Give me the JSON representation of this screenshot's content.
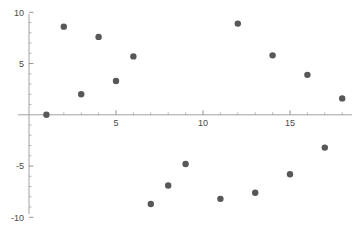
{
  "chart_data": {
    "type": "scatter",
    "title": "",
    "subtitle": "",
    "xlabel": "",
    "ylabel": "",
    "xlim": [
      -0.7,
      18.9
    ],
    "ylim": [
      -10.8,
      11.0
    ],
    "grid": false,
    "legend": null,
    "marker": {
      "shape": "circle",
      "color": "#585858",
      "size": 3.2
    },
    "x_ticks_major": [
      5,
      10,
      15
    ],
    "x_tick_labels": [
      "5",
      "10",
      "15"
    ],
    "x_ticks_minor": [
      1,
      2,
      3,
      4,
      6,
      7,
      8,
      9,
      11,
      12,
      13,
      14,
      16,
      17,
      18
    ],
    "y_ticks_major": [
      10,
      5,
      -5,
      -10
    ],
    "y_tick_labels": [
      "10",
      "5",
      "-5",
      "-10"
    ],
    "y_ticks_minor": [
      9,
      8,
      7,
      6,
      4,
      3,
      2,
      1,
      -1,
      -2,
      -3,
      -4,
      -6,
      -7,
      -8,
      -9
    ],
    "axes": {
      "x_axis_at_y": 0,
      "y_axis_at_x": 0,
      "x_axis_color": "#8a8a8a",
      "y_axis_color": "#8a8a8a"
    },
    "points": [
      {
        "x": 1,
        "y": 0.0
      },
      {
        "x": 2,
        "y": 8.6
      },
      {
        "x": 3,
        "y": 2.0
      },
      {
        "x": 4,
        "y": 7.6
      },
      {
        "x": 5,
        "y": 3.3
      },
      {
        "x": 6,
        "y": 5.7
      },
      {
        "x": 7,
        "y": -8.7
      },
      {
        "x": 8,
        "y": -6.9
      },
      {
        "x": 9,
        "y": -4.8
      },
      {
        "x": 11,
        "y": -8.2
      },
      {
        "x": 12,
        "y": 8.9
      },
      {
        "x": 13,
        "y": -7.6
      },
      {
        "x": 14,
        "y": 5.8
      },
      {
        "x": 15,
        "y": -5.8
      },
      {
        "x": 16,
        "y": 3.9
      },
      {
        "x": 17,
        "y": -3.2
      },
      {
        "x": 18,
        "y": 1.6
      }
    ],
    "x": [
      1,
      2,
      3,
      4,
      5,
      6,
      7,
      8,
      9,
      11,
      12,
      13,
      14,
      15,
      16,
      17,
      18
    ],
    "values": [
      0.0,
      8.6,
      2.0,
      7.6,
      3.3,
      5.7,
      -8.7,
      -6.9,
      -4.8,
      -8.2,
      8.9,
      -7.6,
      5.8,
      -5.8,
      3.9,
      -3.2,
      1.6
    ]
  }
}
